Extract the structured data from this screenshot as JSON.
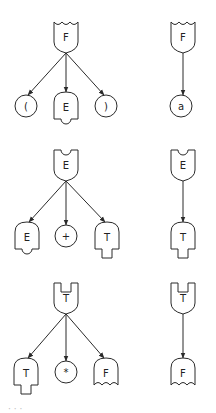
{
  "diagram": {
    "title": "",
    "productions": [
      {
        "id": "F1",
        "parent": {
          "label": "F",
          "symbol": "F"
        },
        "children": [
          {
            "label": "(",
            "symbol": "terminal"
          },
          {
            "label": "E",
            "symbol": "E"
          },
          {
            "label": ")",
            "symbol": "terminal"
          }
        ]
      },
      {
        "id": "F2",
        "parent": {
          "label": "F",
          "symbol": "F"
        },
        "children": [
          {
            "label": "a",
            "symbol": "terminal"
          }
        ]
      },
      {
        "id": "E1",
        "parent": {
          "label": "E",
          "symbol": "E"
        },
        "children": [
          {
            "label": "E",
            "symbol": "E"
          },
          {
            "label": "+",
            "symbol": "terminal"
          },
          {
            "label": "T",
            "symbol": "T"
          }
        ]
      },
      {
        "id": "E2",
        "parent": {
          "label": "E",
          "symbol": "E"
        },
        "children": [
          {
            "label": "T",
            "symbol": "T"
          }
        ]
      },
      {
        "id": "T1",
        "parent": {
          "label": "T",
          "symbol": "T"
        },
        "children": [
          {
            "label": "T",
            "symbol": "T"
          },
          {
            "label": "*",
            "symbol": "terminal"
          },
          {
            "label": "F",
            "symbol": "F"
          }
        ]
      },
      {
        "id": "T2",
        "parent": {
          "label": "T",
          "symbol": "T"
        },
        "children": [
          {
            "label": "F",
            "symbol": "F"
          }
        ]
      }
    ],
    "caption": "· · ·"
  },
  "colors": {
    "stroke": "#2a2a2a",
    "fill": "#ffffff"
  }
}
